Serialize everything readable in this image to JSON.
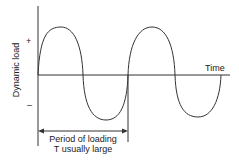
{
  "diagram": {
    "y_axis_label": "Dynamic load",
    "positive_sign": "+",
    "negative_sign": "–",
    "x_axis_label": "Time",
    "period_label_line1": "Period of loading",
    "period_label_line2": "T usually large",
    "stroke_color": "#333333",
    "waveform": "sinusoid",
    "cycles_shown": 2
  }
}
